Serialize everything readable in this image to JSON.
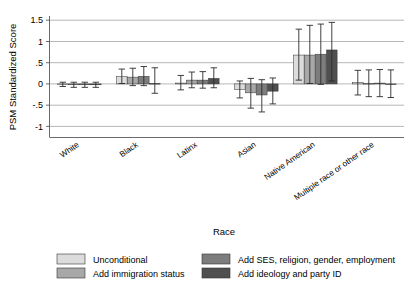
{
  "chart_data": {
    "type": "bar",
    "title": "",
    "xlabel": "Race",
    "ylabel": "PSM Standardized Score",
    "ylim": [
      -1.25,
      1.6
    ],
    "yticks": [
      1.5,
      1,
      0.5,
      0,
      -0.5,
      -1
    ],
    "ytick_labels": [
      "1.5",
      "1",
      ".5",
      "0",
      "-.5",
      "-1"
    ],
    "grid": true,
    "legend_position": "bottom",
    "error_bars": "95% confidence interval",
    "categories": [
      "White",
      "Black",
      "Latinx",
      "Asian",
      "Native American",
      "Multiple race or other race"
    ],
    "series": [
      {
        "name": "Unconditional",
        "color": "#dcdcdc",
        "values": [
          -0.01,
          0.17,
          0.02,
          -0.13,
          0.68,
          0.03
        ],
        "ci_low": [
          -0.06,
          0.01,
          -0.14,
          -0.33,
          0.09,
          -0.26
        ],
        "ci_high": [
          0.04,
          0.35,
          0.2,
          0.07,
          1.29,
          0.32
        ]
      },
      {
        "name": "Add immigration status",
        "color": "#a8a8a8",
        "values": [
          -0.02,
          0.16,
          0.09,
          -0.21,
          0.68,
          0.01
        ],
        "ci_low": [
          -0.08,
          -0.04,
          -0.09,
          -0.57,
          0.01,
          -0.3
        ],
        "ci_high": [
          0.04,
          0.37,
          0.28,
          0.13,
          1.38,
          0.33
        ]
      },
      {
        "name": "Add SES, religion, gender, employment",
        "color": "#7d7d7d",
        "values": [
          -0.02,
          0.18,
          0.09,
          -0.26,
          0.7,
          0.02
        ],
        "ci_low": [
          -0.08,
          -0.04,
          -0.1,
          -0.66,
          -0.01,
          -0.3
        ],
        "ci_high": [
          0.04,
          0.41,
          0.29,
          0.1,
          1.41,
          0.34
        ]
      },
      {
        "name": "Add ideology and party ID",
        "color": "#4f4f4f",
        "values": [
          -0.02,
          0.01,
          0.13,
          -0.17,
          0.8,
          0.0
        ],
        "ci_low": [
          -0.08,
          -0.22,
          -0.09,
          -0.47,
          0.07,
          -0.32
        ],
        "ci_high": [
          0.04,
          0.38,
          0.38,
          0.14,
          1.45,
          0.33
        ]
      }
    ]
  },
  "legend": {
    "entries": [
      {
        "label": "Unconditional",
        "color": "#dcdcdc"
      },
      {
        "label": "Add SES, religion, gender, employment",
        "color": "#7d7d7d"
      },
      {
        "label": "Add immigration status",
        "color": "#a8a8a8"
      },
      {
        "label": "Add ideology and party ID",
        "color": "#4f4f4f"
      }
    ]
  },
  "axes": {
    "y_title": "PSM Standardized Score",
    "x_title": "Race"
  }
}
